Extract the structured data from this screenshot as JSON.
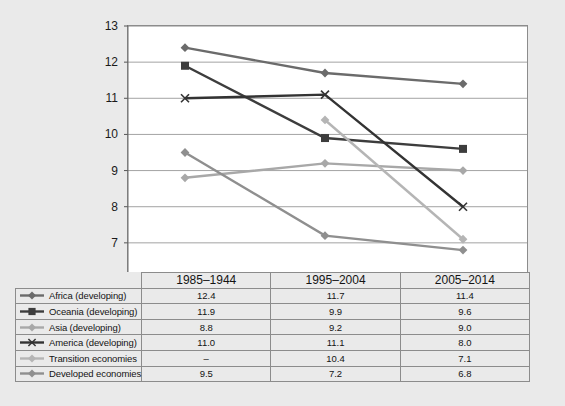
{
  "chart_data": {
    "type": "line",
    "title": "",
    "xlabel": "",
    "ylabel": "",
    "ylim": [
      6,
      13
    ],
    "yticks": [
      6,
      7,
      8,
      9,
      10,
      11,
      12,
      13
    ],
    "grid": true,
    "legend_position": "table-left",
    "categories": [
      "1985–1944",
      "1995–2004",
      "2005–2014"
    ],
    "series": [
      {
        "name": "Africa (developing)",
        "values": [
          12.4,
          11.7,
          11.4
        ],
        "labels": [
          "12.4",
          "11.7",
          "11.4"
        ],
        "color": "#6b6b6b",
        "marker": "diamond"
      },
      {
        "name": "Oceania (developing)",
        "values": [
          11.9,
          9.9,
          9.6
        ],
        "labels": [
          "11.9",
          "9.9",
          "9.6"
        ],
        "color": "#3d3d3d",
        "marker": "square"
      },
      {
        "name": "Asia (developing)",
        "values": [
          8.8,
          9.2,
          9.0
        ],
        "labels": [
          "8.8",
          "9.2",
          "9.0"
        ],
        "color": "#a8a8a8",
        "marker": "diamond"
      },
      {
        "name": "America (developing)",
        "values": [
          11.0,
          11.1,
          8.0
        ],
        "labels": [
          "11.0",
          "11.1",
          "8.0"
        ],
        "color": "#333333",
        "marker": "x"
      },
      {
        "name": "Transition economies",
        "values": [
          null,
          10.4,
          7.1
        ],
        "labels": [
          "–",
          "10.4",
          "7.1"
        ],
        "color": "#b5b5b5",
        "marker": "diamond"
      },
      {
        "name": "Developed economies",
        "values": [
          9.5,
          7.2,
          6.8
        ],
        "labels": [
          "9.5",
          "7.2",
          "6.8"
        ],
        "color": "#8f8f8f",
        "marker": "diamond"
      }
    ]
  },
  "table": {
    "header_blank": "",
    "columns": [
      "1985–1944",
      "1995–2004",
      "2005–2014"
    ],
    "rows": [
      {
        "label": "Africa (developing)",
        "values": [
          "12.4",
          "11.7",
          "11.4"
        ]
      },
      {
        "label": "Oceania (developing)",
        "values": [
          "11.9",
          "9.9",
          "9.6"
        ]
      },
      {
        "label": "Asia (developing)",
        "values": [
          "8.8",
          "9.2",
          "9.0"
        ]
      },
      {
        "label": "America (developing)",
        "values": [
          "11.0",
          "11.1",
          "8.0"
        ]
      },
      {
        "label": "Transition economies",
        "values": [
          "–",
          "10.4",
          "7.1"
        ]
      },
      {
        "label": "Developed economies",
        "values": [
          "9.5",
          "7.2",
          "6.8"
        ]
      }
    ]
  },
  "axis": {
    "y_labels": [
      "13",
      "12",
      "11",
      "10",
      "9",
      "8",
      "7",
      "6"
    ]
  }
}
